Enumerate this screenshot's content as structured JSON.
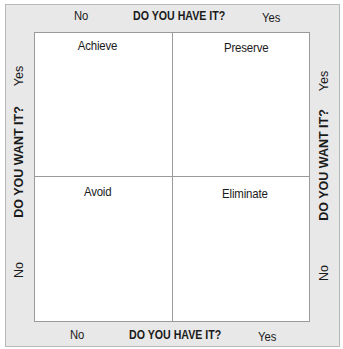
{
  "diagram": {
    "type": "2x2 matrix",
    "top_axis": {
      "title": "DO YOU HAVE IT?",
      "left": "No",
      "right": "Yes"
    },
    "bottom_axis": {
      "title": "DO YOU HAVE IT?",
      "left": "No",
      "right": "Yes"
    },
    "left_axis": {
      "title": "DO YOU WANT IT?",
      "top": "Yes",
      "bottom": "No"
    },
    "right_axis": {
      "title": "DO YOU WANT IT?",
      "top": "Yes",
      "bottom": "No"
    },
    "quadrants": {
      "top_left": "Achieve",
      "top_right": "Preserve",
      "bottom_left": "Avoid",
      "bottom_right": "Eliminate"
    },
    "colors": {
      "frame": "#e8e8e8",
      "grid": "#ffffff",
      "lines": "#9a9a9a"
    }
  }
}
